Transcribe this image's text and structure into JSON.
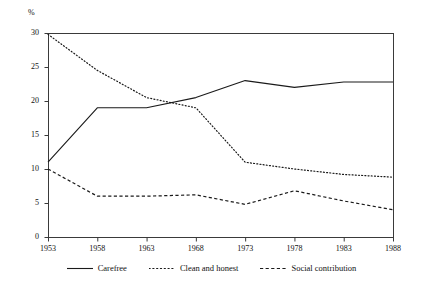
{
  "chart_data": {
    "type": "line",
    "title": "",
    "xlabel": "",
    "ylabel": "%",
    "unit_label": "%",
    "categories": [
      "1953",
      "1958",
      "1963",
      "1968",
      "1973",
      "1978",
      "1983",
      "1988"
    ],
    "x": [
      1953,
      1958,
      1963,
      1968,
      1973,
      1978,
      1983,
      1988
    ],
    "xlim": [
      1953,
      1988
    ],
    "ylim": [
      0,
      30
    ],
    "yticks": [
      0,
      5,
      10,
      15,
      20,
      25,
      30
    ],
    "ytick_labels": [
      "0",
      "5",
      "10",
      "15",
      "20",
      "25",
      "30"
    ],
    "grid": false,
    "legend_position": "bottom",
    "series": [
      {
        "name": "Carefree",
        "style": "solid",
        "color": "#1a1a1a",
        "values": [
          11.0,
          19.0,
          19.0,
          20.5,
          23.0,
          22.0,
          22.8,
          22.8
        ]
      },
      {
        "name": "Clean and honest",
        "style": "dotted",
        "color": "#1a1a1a",
        "values": [
          29.8,
          24.5,
          20.5,
          19.0,
          11.0,
          10.0,
          9.2,
          8.8
        ]
      },
      {
        "name": "Social contribution",
        "style": "dashed",
        "color": "#1a1a1a",
        "values": [
          10.0,
          6.0,
          6.0,
          6.2,
          4.8,
          6.8,
          5.3,
          4.0
        ]
      }
    ]
  },
  "legend": {
    "entries": [
      {
        "label": "Carefree"
      },
      {
        "label": "Clean and honest"
      },
      {
        "label": "Social contribution"
      }
    ]
  },
  "axes": {
    "unit": "%",
    "y_labels": [
      "30",
      "25",
      "20",
      "15",
      "10",
      "5",
      "0"
    ],
    "x_labels": [
      "1953",
      "1958",
      "1963",
      "1968",
      "1973",
      "1978",
      "1983",
      "1988"
    ]
  }
}
